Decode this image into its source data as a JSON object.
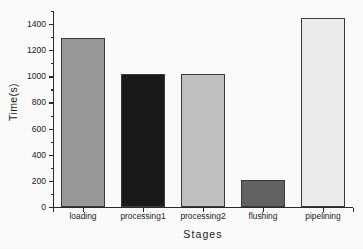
{
  "chart_data": {
    "type": "bar",
    "title": "",
    "xlabel": "Stages",
    "ylabel": "Time(s)",
    "categories": [
      "loading",
      "processing1",
      "processing2",
      "flushing",
      "pipelining"
    ],
    "values": [
      1290,
      1015,
      1020,
      210,
      1445
    ],
    "series": [
      {
        "name": "Time(s)",
        "values": [
          1290,
          1015,
          1020,
          210,
          1445
        ]
      }
    ],
    "bar_colors": [
      "#9a9a9a",
      "#1a1a1a",
      "#c2c2c2",
      "#636363",
      "#eeeeee"
    ],
    "bar_edge_color": "#3a3a3a",
    "ylim": [
      0,
      1500
    ],
    "ytick_labels": [
      "0",
      "200",
      "400",
      "600",
      "800",
      "1000",
      "1200",
      "1400"
    ],
    "ytick_values": [
      0,
      200,
      400,
      600,
      800,
      1000,
      1200,
      1400
    ],
    "minor_tick_values": [
      100,
      300,
      500,
      700,
      900,
      1100,
      1300,
      1500
    ],
    "grid": false,
    "legend": false,
    "legend_position": "none",
    "axis_color": "#2b2b2b",
    "background_color": "#fdfdfd"
  }
}
